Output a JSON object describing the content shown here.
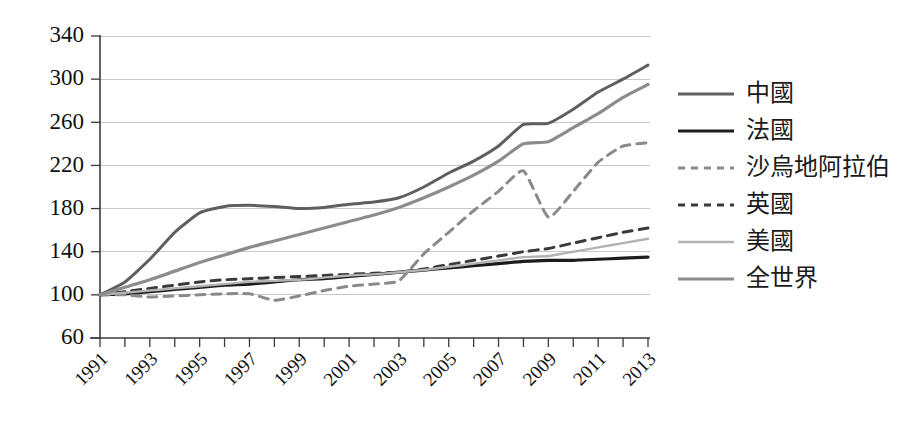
{
  "chart_data": {
    "type": "line",
    "title": "",
    "subtitle": "",
    "xlabel": "",
    "ylabel": "",
    "xlim": [
      1991,
      2013
    ],
    "ylim": [
      60,
      340
    ],
    "y_ticks": [
      60,
      100,
      140,
      180,
      220,
      260,
      300,
      340
    ],
    "x_ticks": [
      1991,
      1993,
      1995,
      1997,
      1999,
      2001,
      2003,
      2005,
      2007,
      2009,
      2011,
      2013
    ],
    "x_minor_step": 1,
    "grid": "horizontal",
    "legend_position": "right",
    "x": [
      1991,
      1992,
      1993,
      1994,
      1995,
      1996,
      1997,
      1998,
      1999,
      2000,
      2001,
      2002,
      2003,
      2004,
      2005,
      2006,
      2007,
      2008,
      2009,
      2010,
      2011,
      2012,
      2013
    ],
    "series": [
      {
        "name": "中國",
        "color": "#5f5f5f",
        "width": 3.0,
        "dash": "none",
        "values": [
          100,
          112,
          133,
          158,
          176,
          182,
          183,
          182,
          180,
          181,
          184,
          186,
          190,
          200,
          213,
          224,
          238,
          258,
          259,
          272,
          288,
          300,
          313
        ]
      },
      {
        "name": "法國",
        "color": "#1c1c1c",
        "width": 3.2,
        "dash": "none",
        "values": [
          100,
          101,
          103,
          105,
          107,
          109,
          110,
          112,
          114,
          115,
          117,
          119,
          121,
          123,
          125,
          127,
          129,
          131,
          132,
          132,
          133,
          134,
          135
        ]
      },
      {
        "name": "沙烏地阿拉伯",
        "color": "#8a8a8a",
        "width": 3.0,
        "dash": "9,7",
        "values": [
          100,
          100,
          98,
          99,
          100,
          101,
          101,
          95,
          99,
          104,
          108,
          110,
          113,
          138,
          158,
          178,
          196,
          215,
          172,
          196,
          223,
          238,
          241
        ]
      },
      {
        "name": "英國",
        "color": "#3a3a3a",
        "width": 3.0,
        "dash": "9,7",
        "values": [
          100,
          103,
          106,
          109,
          112,
          114,
          115,
          116,
          117,
          118,
          119,
          120,
          121,
          124,
          128,
          132,
          136,
          140,
          143,
          148,
          153,
          158,
          162
        ]
      },
      {
        "name": "美國",
        "color": "#b3b3b3",
        "width": 2.4,
        "dash": "none",
        "values": [
          100,
          102,
          104,
          106,
          108,
          110,
          112,
          113,
          114,
          116,
          118,
          119,
          121,
          123,
          126,
          129,
          132,
          135,
          136,
          140,
          144,
          148,
          152
        ]
      },
      {
        "name": "全世界",
        "color": "#8c8c8c",
        "width": 3.2,
        "dash": "none",
        "values": [
          100,
          107,
          114,
          122,
          130,
          137,
          144,
          150,
          156,
          162,
          168,
          174,
          181,
          190,
          200,
          211,
          224,
          240,
          242,
          255,
          268,
          283,
          295
        ]
      }
    ]
  },
  "legend": {
    "items": [
      {
        "label": "中國"
      },
      {
        "label": "法國"
      },
      {
        "label": "沙烏地阿拉伯"
      },
      {
        "label": "英國"
      },
      {
        "label": "美國"
      },
      {
        "label": "全世界"
      }
    ]
  }
}
